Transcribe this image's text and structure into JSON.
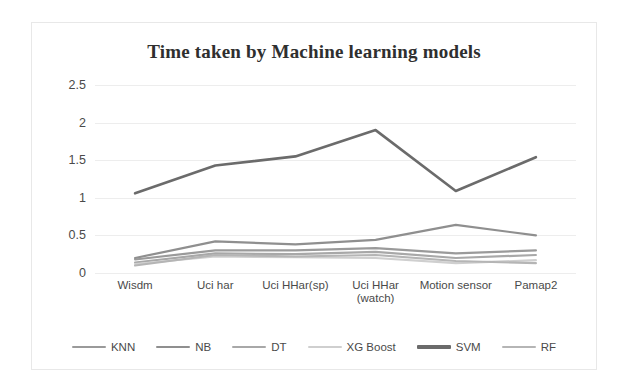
{
  "chart_data": {
    "type": "line",
    "title": "Time taken by Machine learning models",
    "xlabel": "",
    "ylabel": "",
    "categories": [
      "Wisdm",
      "Uci har",
      "Uci HHar(sp)",
      "Uci HHar\n(watch)",
      "Motion sensor",
      "Pamap2"
    ],
    "yticks": [
      "0",
      "0.5",
      "1",
      "1.5",
      "2",
      "2.5"
    ],
    "ylim": [
      0,
      2.5
    ],
    "grid": true,
    "legend_position": "bottom",
    "series": [
      {
        "name": "KNN",
        "color": "#9a9a9a",
        "width": 2.2,
        "values": [
          0.18,
          0.3,
          0.3,
          0.33,
          0.26,
          0.3
        ]
      },
      {
        "name": "NB",
        "color": "#8f8f8f",
        "width": 2.2,
        "values": [
          0.2,
          0.42,
          0.38,
          0.44,
          0.64,
          0.5
        ]
      },
      {
        "name": "DT",
        "color": "#a8a8a8",
        "width": 2.2,
        "values": [
          0.14,
          0.26,
          0.25,
          0.28,
          0.2,
          0.24
        ]
      },
      {
        "name": "XG Boost",
        "color": "#cfcfcf",
        "width": 2.2,
        "values": [
          0.12,
          0.22,
          0.21,
          0.2,
          0.13,
          0.17
        ]
      },
      {
        "name": "SVM",
        "color": "#6b6b6b",
        "width": 2.6,
        "values": [
          1.06,
          1.43,
          1.55,
          1.9,
          1.09,
          1.54
        ]
      },
      {
        "name": "RF",
        "color": "#b5b5b5",
        "width": 2.2,
        "values": [
          0.1,
          0.24,
          0.22,
          0.24,
          0.16,
          0.13
        ]
      }
    ]
  }
}
